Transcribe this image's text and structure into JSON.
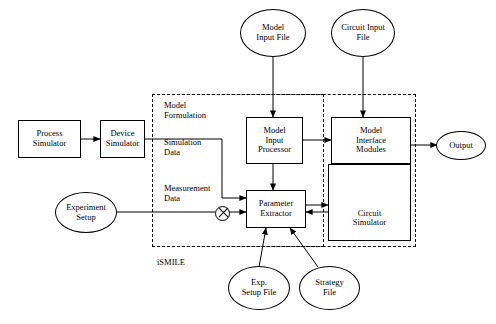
{
  "diagram": {
    "boundary_label": "iSMILE",
    "region_label": "Model\nFormulation",
    "nodes": [
      {
        "id": "process-simulator",
        "label": "Process\nSimulator"
      },
      {
        "id": "device-simulator",
        "label": "Device\nSimulator"
      },
      {
        "id": "model-input-processor",
        "label": "Model\nInput\nProcessor"
      },
      {
        "id": "model-interface-modules",
        "label": "Model\nInterface\nModules"
      },
      {
        "id": "parameter-extractor",
        "label": "Parameter\nExtractor"
      },
      {
        "id": "circuit-simulator",
        "label": "Circuit\nSimulator"
      }
    ],
    "ellipses": [
      {
        "id": "model-input-file",
        "label": "Model\nInput File"
      },
      {
        "id": "circuit-input-file",
        "label": "Circuit Input\nFile"
      },
      {
        "id": "output",
        "label": "Output"
      },
      {
        "id": "experiment-setup",
        "label": "Experiment\nSetup"
      },
      {
        "id": "exp-setup-file",
        "label": "Exp.\nSetup File"
      },
      {
        "id": "strategy-file",
        "label": "Strategy\nFile"
      }
    ],
    "edge_labels": [
      {
        "id": "simulation-data",
        "label": "Simulation\nData"
      },
      {
        "id": "measurement-data",
        "label": "Measurement\nData"
      }
    ]
  }
}
